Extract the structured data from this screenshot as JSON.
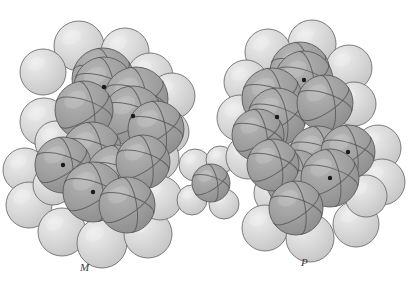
{
  "figure": {
    "kind": "space-filling-molecular-model-pair",
    "background_color": "#ffffff",
    "width": 414,
    "height": 287
  },
  "palette": {
    "hydrogen_fill": "#d3d3d3",
    "hydrogen_fill_light": "#dcdcdc",
    "hydrogen_shade": "#c2c2c2",
    "carbon_fill": "#9d9d9d",
    "carbon_fill_light": "#ababab",
    "carbon_shade": "#8d8d8d",
    "outline": "#6f6f6f",
    "outline_dark": "#5a5a5a",
    "bond_arc": "#585858",
    "center_dot": "#1a1a1a",
    "highlight": "#f2f2f2",
    "label_color": "#3a3a3a"
  },
  "labels": {
    "left": "M",
    "right": "P"
  },
  "atoms": {
    "carbon_marker": "carbon-center-dot",
    "hydrogen_sphere": "hydrogen-sphere",
    "carbon_sphere": "carbon-sphere"
  },
  "molecules": [
    {
      "id": "left-molecule",
      "name": "left-enantiomer-model",
      "label": "M",
      "label_position": {
        "x": 80,
        "y": 261
      },
      "carbon_atoms": [
        {
          "cx": 103,
          "cy": 79,
          "r": 31,
          "dot": false
        },
        {
          "cx": 104,
          "cy": 87,
          "r": 30,
          "dot": true
        },
        {
          "cx": 136,
          "cy": 99,
          "r": 32,
          "dot": false
        },
        {
          "cx": 133,
          "cy": 116,
          "r": 30,
          "dot": true
        },
        {
          "cx": 84,
          "cy": 110,
          "r": 29,
          "dot": false
        },
        {
          "cx": 156,
          "cy": 129,
          "r": 28,
          "dot": false
        },
        {
          "cx": 92,
          "cy": 152,
          "r": 30,
          "dot": false
        },
        {
          "cx": 63,
          "cy": 165,
          "r": 28,
          "dot": true
        },
        {
          "cx": 117,
          "cy": 176,
          "r": 31,
          "dot": false
        },
        {
          "cx": 93,
          "cy": 192,
          "r": 30,
          "dot": true
        },
        {
          "cx": 143,
          "cy": 162,
          "r": 27,
          "dot": false
        },
        {
          "cx": 127,
          "cy": 205,
          "r": 28,
          "dot": false
        }
      ],
      "hydrogen_atoms": [
        {
          "cx": 79,
          "cy": 46,
          "r": 25
        },
        {
          "cx": 125,
          "cy": 52,
          "r": 24
        },
        {
          "cx": 43,
          "cy": 72,
          "r": 23
        },
        {
          "cx": 150,
          "cy": 76,
          "r": 23
        },
        {
          "cx": 44,
          "cy": 122,
          "r": 24
        },
        {
          "cx": 172,
          "cy": 96,
          "r": 23
        },
        {
          "cx": 167,
          "cy": 132,
          "r": 22
        },
        {
          "cx": 56,
          "cy": 142,
          "r": 21
        },
        {
          "cx": 25,
          "cy": 170,
          "r": 22
        },
        {
          "cx": 29,
          "cy": 205,
          "r": 23
        },
        {
          "cx": 156,
          "cy": 158,
          "r": 23
        },
        {
          "cx": 62,
          "cy": 232,
          "r": 24
        },
        {
          "cx": 102,
          "cy": 243,
          "r": 25
        },
        {
          "cx": 148,
          "cy": 234,
          "r": 24
        },
        {
          "cx": 160,
          "cy": 198,
          "r": 22
        },
        {
          "cx": 53,
          "cy": 185,
          "r": 20
        }
      ]
    },
    {
      "id": "middle-molecule",
      "name": "small-methane-model",
      "label": "",
      "carbon_atoms": [
        {
          "cx": 211,
          "cy": 183,
          "r": 19,
          "dot": false
        }
      ],
      "hydrogen_atoms": [
        {
          "cx": 195,
          "cy": 165,
          "r": 16
        },
        {
          "cx": 220,
          "cy": 160,
          "r": 14
        },
        {
          "cx": 192,
          "cy": 200,
          "r": 15
        },
        {
          "cx": 224,
          "cy": 204,
          "r": 15
        }
      ]
    },
    {
      "id": "right-molecule",
      "name": "right-enantiomer-model",
      "label": "P",
      "label_position": {
        "x": 301,
        "y": 256
      },
      "carbon_atoms": [
        {
          "cx": 300,
          "cy": 72,
          "r": 30,
          "dot": false
        },
        {
          "cx": 304,
          "cy": 80,
          "r": 29,
          "dot": true
        },
        {
          "cx": 272,
          "cy": 98,
          "r": 30,
          "dot": false
        },
        {
          "cx": 277,
          "cy": 117,
          "r": 29,
          "dot": true
        },
        {
          "cx": 325,
          "cy": 103,
          "r": 28,
          "dot": false
        },
        {
          "cx": 258,
          "cy": 135,
          "r": 26,
          "dot": false
        },
        {
          "cx": 318,
          "cy": 155,
          "r": 29,
          "dot": false
        },
        {
          "cx": 348,
          "cy": 152,
          "r": 27,
          "dot": true
        },
        {
          "cx": 296,
          "cy": 180,
          "r": 30,
          "dot": false
        },
        {
          "cx": 330,
          "cy": 178,
          "r": 29,
          "dot": true
        },
        {
          "cx": 273,
          "cy": 165,
          "r": 26,
          "dot": false
        },
        {
          "cx": 296,
          "cy": 208,
          "r": 27,
          "dot": false
        }
      ],
      "hydrogen_atoms": [
        {
          "cx": 312,
          "cy": 44,
          "r": 24
        },
        {
          "cx": 268,
          "cy": 52,
          "r": 23
        },
        {
          "cx": 349,
          "cy": 68,
          "r": 23
        },
        {
          "cx": 246,
          "cy": 82,
          "r": 22
        },
        {
          "cx": 354,
          "cy": 104,
          "r": 22
        },
        {
          "cx": 240,
          "cy": 118,
          "r": 23
        },
        {
          "cx": 248,
          "cy": 157,
          "r": 22
        },
        {
          "cx": 283,
          "cy": 152,
          "r": 21
        },
        {
          "cx": 378,
          "cy": 148,
          "r": 23
        },
        {
          "cx": 382,
          "cy": 182,
          "r": 23
        },
        {
          "cx": 276,
          "cy": 193,
          "r": 22
        },
        {
          "cx": 265,
          "cy": 228,
          "r": 23
        },
        {
          "cx": 310,
          "cy": 238,
          "r": 24
        },
        {
          "cx": 356,
          "cy": 224,
          "r": 23
        },
        {
          "cx": 366,
          "cy": 196,
          "r": 21
        }
      ]
    }
  ]
}
